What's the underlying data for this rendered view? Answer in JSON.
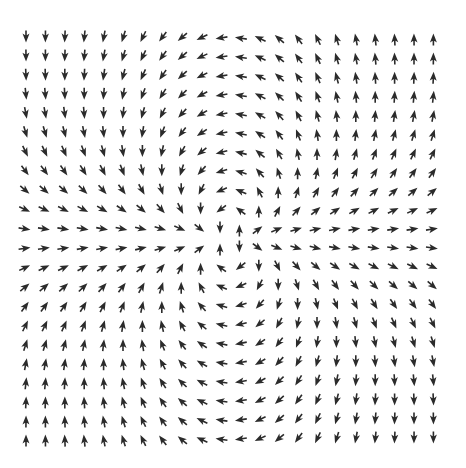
{
  "figure": {
    "type": "vector-field",
    "background": "#ffffff",
    "arrow_color": "#2b2b2b",
    "grid": {
      "cols": 22,
      "rows": 22,
      "x0": 26,
      "y0": 38,
      "dx": 19.4,
      "dy": 19.1
    },
    "arrow": {
      "length": 9,
      "head_width": 7
    },
    "field_model": "vx = sin^2(pi*u/2) - sin^2(pi*w/2); vy = sin(pi*u/2)*sin(pi*w/2) with u,w normalized to [-1,1] across grid",
    "observed_directions": {
      "top_left": "down",
      "top_center": "left",
      "top_right": "up",
      "middle_left": "right",
      "center": "saddle (mixed up/down)",
      "middle_right": "right",
      "bottom_left": "up",
      "bottom_center": "left",
      "bottom_right": "down"
    }
  }
}
